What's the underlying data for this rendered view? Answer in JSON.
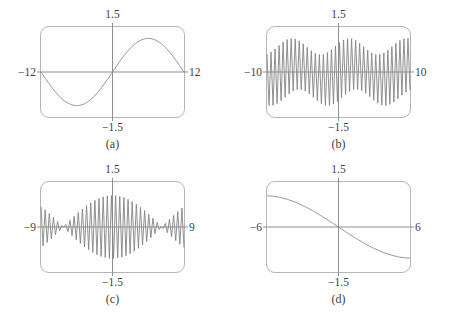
{
  "figure": {
    "background": "#fefefe",
    "text_color": "#3e3e3e",
    "box_border_color": "#b5b5b5",
    "axis_color": "#8f8f8f",
    "curve_color": "#848484"
  },
  "chart_data": [
    {
      "panel": "a",
      "type": "line",
      "caption": "(a)",
      "xlim": [
        -12,
        12
      ],
      "ylim": [
        -1.5,
        1.5
      ],
      "labels": {
        "y_top": "1.5",
        "y_bottom": "−1.5",
        "x_left": "−12",
        "x_right": "12"
      },
      "curve": {
        "kind": "sine",
        "amplitude": 1.12,
        "period": 24,
        "sign": 1,
        "samples": 160,
        "description": "single smooth sine cycle: zero at −12, minimum near x=−6, zero at 0, maximum near x=6, zero at 12"
      }
    },
    {
      "panel": "b",
      "type": "line",
      "caption": "(b)",
      "xlim": [
        -10,
        10
      ],
      "ylim": [
        -1.5,
        1.5
      ],
      "labels": {
        "y_top": "1.5",
        "y_bottom": "−1.5",
        "x_left": "−10",
        "x_right": "10"
      },
      "curve": {
        "kind": "zigzag_beats",
        "extremes": 72,
        "top_envelope": {
          "base": 0.85,
          "mod": 0.27,
          "period": 8,
          "peak_at": 1.5
        },
        "bottom_envelope": {
          "base": 0.85,
          "mod": 0.27,
          "period": 8,
          "peak_at": 6.5
        },
        "description": "dense sawtooth oscillation filling the window, amplitude waxing and waning between about 0.55 and 1.1"
      }
    },
    {
      "panel": "c",
      "type": "line",
      "caption": "(c)",
      "xlim": [
        -9,
        9
      ],
      "ylim": [
        -1.5,
        1.5
      ],
      "labels": {
        "y_top": "1.5",
        "y_bottom": "−1.5",
        "x_left": "−9",
        "x_right": "9"
      },
      "curve": {
        "kind": "beats",
        "peak_amplitude": 1.05,
        "node_at": 6.2,
        "extremes": 70,
        "description": "beat pattern: large central lobe peaking near 1.05 at x=0, nodes near x=±6.2, smaller lobes at the edges"
      }
    },
    {
      "panel": "d",
      "type": "line",
      "caption": "(d)",
      "xlim": [
        -6,
        6
      ],
      "ylim": [
        -1.5,
        1.5
      ],
      "labels": {
        "y_top": "1.5",
        "y_bottom": "−1.5",
        "x_left": "−6",
        "x_right": "6"
      },
      "curve": {
        "kind": "sine",
        "amplitude": 1.04,
        "period": 24.8,
        "sign": -1,
        "samples": 160,
        "description": "smooth decreasing S-curve from about +1.05 at x=−6 through the origin to about −1.0 at x=6"
      }
    }
  ]
}
